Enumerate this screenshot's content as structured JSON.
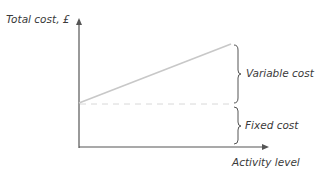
{
  "diagram": {
    "y_axis_label": "Total cost, £",
    "x_axis_label": "Activity level",
    "brace_labels": {
      "variable": "Variable cost",
      "fixed": "Fixed cost"
    },
    "colors": {
      "axis": "#555555",
      "total_cost_line": "#c8c8c8",
      "fixed_cost_dashed": "#d8d8d8",
      "brace": "#555555",
      "text": "#3a3a3a"
    }
  }
}
